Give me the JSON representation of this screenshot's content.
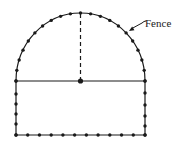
{
  "diagram": {
    "title": "",
    "labels": {
      "fence": "Fence"
    },
    "colors": {
      "stroke": "#1a1a1a",
      "background": "#ffffff"
    },
    "shape": {
      "description": "Rectangle surmounted by a semicircle, with fence posts (dots) along the perimeter",
      "rect": {
        "left": 16,
        "right": 145,
        "top": 81,
        "bottom": 135
      },
      "semicircle": {
        "cx": 80.5,
        "cy": 81,
        "rx": 64.5,
        "ry": 68
      },
      "arc_posts": 21,
      "bottom_posts": 12,
      "side_posts_left_y": [
        81,
        94,
        104,
        114,
        124,
        135
      ],
      "side_posts_right_y": [
        81,
        93,
        105,
        116,
        126,
        135
      ],
      "center_point": {
        "x": 80.5,
        "y": 81
      },
      "radius_line": {
        "style": "dashed",
        "from": "center",
        "to": "top-of-arc"
      },
      "diameter_line": {
        "style": "solid"
      }
    },
    "annotation": {
      "arrow_tip": {
        "x": 129,
        "y": 31
      },
      "arrow_tail": {
        "x": 144,
        "y": 22
      },
      "text_pos": {
        "x": 145,
        "y": 27
      }
    }
  }
}
